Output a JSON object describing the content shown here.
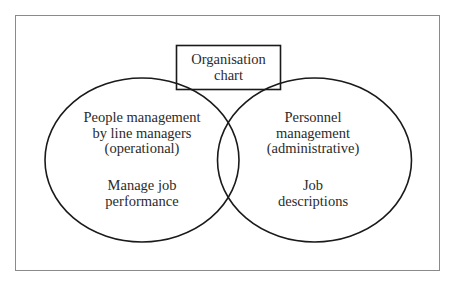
{
  "diagram": {
    "type": "venn",
    "top_box": {
      "lines": [
        "Organisation",
        "chart"
      ]
    },
    "left_circle": {
      "heading_lines": [
        "People management",
        "by line managers",
        "(operational)"
      ],
      "detail_lines": [
        "Manage job",
        "performance"
      ]
    },
    "right_circle": {
      "heading_lines": [
        "Personnel",
        "management",
        "(administrative)"
      ],
      "detail_lines": [
        "Job",
        "descriptions"
      ]
    },
    "colors": {
      "stroke": "#1a1a1a",
      "frame": "#8a8a8a",
      "text": "#2b2b2b",
      "background": "#ffffff"
    }
  }
}
